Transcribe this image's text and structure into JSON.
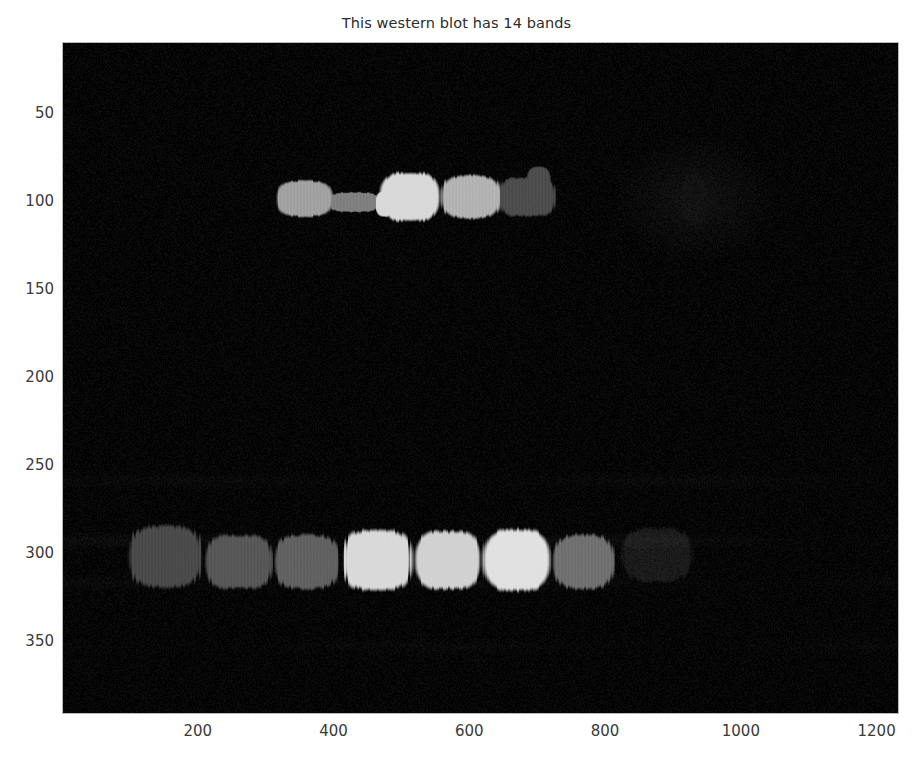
{
  "figure": {
    "title": "This western blot has 14 bands",
    "band_count": 14,
    "background_color": "#050505",
    "frame_color": "#b8b8b8",
    "text_color": "#3a3a3a"
  },
  "axes": {
    "x_ticks": [
      200,
      400,
      600,
      800,
      1000,
      1200
    ],
    "y_ticks": [
      50,
      100,
      150,
      200,
      250,
      300,
      350
    ],
    "x_tick_labels": [
      "200",
      "400",
      "600",
      "800",
      "1000",
      "1200"
    ],
    "y_tick_labels": [
      "50",
      "100",
      "150",
      "200",
      "250",
      "300",
      "350"
    ],
    "xlim": [
      0,
      1230
    ],
    "ylim": [
      10,
      390
    ],
    "xlabel": "",
    "ylabel": "",
    "grid": false
  },
  "chart_data": {
    "type": "heatmap",
    "title": "This western blot has 14 bands",
    "xlabel": "",
    "ylabel": "",
    "xlim": [
      0,
      1230
    ],
    "ylim": [
      10,
      390
    ],
    "grid": false,
    "legend": null,
    "image_kind": "simulated-western-blot",
    "background_intensity": 0.02,
    "noise": {
      "type": "speckle",
      "amplitude": 0.06
    },
    "rows": [
      {
        "name": "upper-row",
        "y_center": 98,
        "bands": [
          {
            "index": 1,
            "x_center": 355,
            "x_width": 80,
            "y_center": 98,
            "y_height": 20,
            "intensity": 0.63,
            "color": "#a1a1a1"
          },
          {
            "index": 2,
            "x_center": 428,
            "x_width": 78,
            "y_center": 100,
            "y_height": 11,
            "intensity": 0.5,
            "color": "#808080"
          },
          {
            "index": 3,
            "x_center": 510,
            "x_width": 88,
            "y_center": 97,
            "y_height": 27,
            "intensity": 0.85,
            "color": "#d9d9d9"
          },
          {
            "index": 4,
            "x_center": 600,
            "x_width": 86,
            "y_center": 97,
            "y_height": 24,
            "intensity": 0.7,
            "color": "#b3b3b3"
          },
          {
            "index": 5,
            "x_center": 683,
            "x_width": 82,
            "y_center": 97,
            "y_height": 22,
            "intensity": 0.3,
            "color": "#4d4d4d"
          },
          {
            "index": 6,
            "x_center": 930,
            "x_width": 48,
            "y_center": 98,
            "y_height": 30,
            "intensity": 0.06,
            "color": "#101010"
          }
        ]
      },
      {
        "name": "lower-row",
        "y_center": 303,
        "bands": [
          {
            "index": 7,
            "x_center": 150,
            "x_width": 108,
            "y_center": 301,
            "y_height": 34,
            "intensity": 0.29,
            "color": "#4a4a4a"
          },
          {
            "index": 8,
            "x_center": 258,
            "x_width": 98,
            "y_center": 304,
            "y_height": 30,
            "intensity": 0.34,
            "color": "#585858"
          },
          {
            "index": 9,
            "x_center": 358,
            "x_width": 96,
            "y_center": 304,
            "y_height": 30,
            "intensity": 0.38,
            "color": "#616161"
          },
          {
            "index": 10,
            "x_center": 462,
            "x_width": 100,
            "y_center": 303,
            "y_height": 34,
            "intensity": 0.85,
            "color": "#d9d9d9"
          },
          {
            "index": 11,
            "x_center": 566,
            "x_width": 96,
            "y_center": 303,
            "y_height": 32,
            "intensity": 0.82,
            "color": "#d2d2d2"
          },
          {
            "index": 12,
            "x_center": 668,
            "x_width": 96,
            "y_center": 303,
            "y_height": 34,
            "intensity": 0.88,
            "color": "#e0e0e0"
          },
          {
            "index": 13,
            "x_center": 766,
            "x_width": 90,
            "y_center": 304,
            "y_height": 30,
            "intensity": 0.44,
            "color": "#707070"
          },
          {
            "index": 14,
            "x_center": 874,
            "x_width": 104,
            "y_center": 300,
            "y_height": 30,
            "intensity": 0.1,
            "color": "#1a1a1a"
          }
        ]
      }
    ]
  }
}
